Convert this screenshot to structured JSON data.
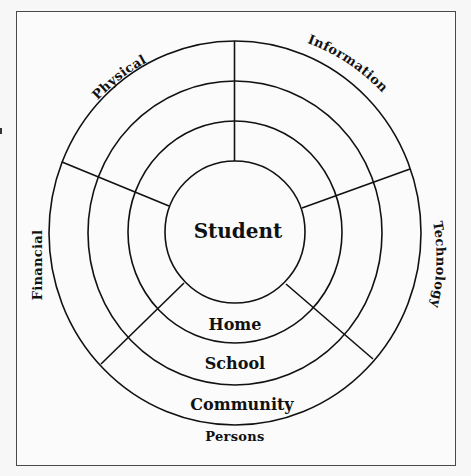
{
  "diagram": {
    "type": "concentric-circle-sector-diagram",
    "center_label": "Student",
    "rings": [
      {
        "label": "Home"
      },
      {
        "label": "School"
      },
      {
        "label": "Community"
      }
    ],
    "outer_label": "Persons",
    "sectors": [
      {
        "label": "Physical",
        "position": "top-left"
      },
      {
        "label": "Information",
        "position": "top-right"
      },
      {
        "label": "Technology",
        "position": "right"
      },
      {
        "label": "Persons",
        "position": "bottom"
      },
      {
        "label": "Financial",
        "position": "left"
      }
    ],
    "colors": {
      "line": "#111111",
      "background": "#fbfbfb",
      "frame": "#4a4a4a"
    }
  }
}
